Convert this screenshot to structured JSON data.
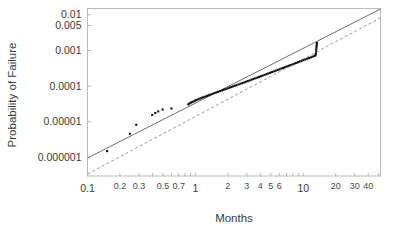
{
  "chart_data": {
    "type": "scatter",
    "title": "",
    "xlabel": "Months",
    "ylabel": "Probability of Failure",
    "xscale": "log",
    "yscale": "log",
    "xlim": [
      0.1,
      52
    ],
    "ylim": [
      3e-07,
      0.015
    ],
    "grid": false,
    "legend": "none",
    "xticks": [
      0.1,
      0.2,
      0.3,
      0.5,
      0.7,
      1,
      2,
      3,
      4,
      5,
      6,
      10,
      20,
      30,
      40
    ],
    "xtick_labels": [
      "0.1",
      "0.2",
      "0.3",
      "0.5",
      "0.7",
      "1",
      "2",
      "3",
      "4",
      "5",
      "6",
      "10",
      "20",
      "30",
      "40"
    ],
    "xtick_major": [
      "0.1",
      "1",
      "10"
    ],
    "yticks": [
      0.01,
      0.005,
      0.001,
      0.0001,
      1e-05,
      1e-06
    ],
    "ytick_labels": [
      "0.01",
      "0.005",
      "0.001",
      "0.0001",
      "0.00001",
      "0.000001"
    ],
    "series": [
      {
        "name": "Observed failures",
        "type": "scatter",
        "marker": "square",
        "color": "#101010",
        "points": [
          [
            0.152,
            1.5e-06
          ],
          [
            0.247,
            4.6e-06
          ],
          [
            0.283,
            8.2e-06
          ],
          [
            0.398,
            1.55e-05
          ],
          [
            0.425,
            1.75e-05
          ],
          [
            0.452,
            1.95e-05
          ],
          [
            0.497,
            2.2e-05
          ],
          [
            0.6,
            2.35e-05
          ],
          [
            0.86,
            3.05e-05
          ],
          [
            0.88,
            3.25e-05
          ],
          [
            0.905,
            3.4e-05
          ],
          [
            0.93,
            3.55e-05
          ],
          [
            0.96,
            3.7e-05
          ],
          [
            0.99,
            3.9e-05
          ],
          [
            1.02,
            4.05e-05
          ],
          [
            1.06,
            4.25e-05
          ],
          [
            1.1,
            4.45e-05
          ],
          [
            1.14,
            4.65e-05
          ],
          [
            1.18,
            4.85e-05
          ],
          [
            1.23,
            5.05e-05
          ],
          [
            1.28,
            5.3e-05
          ],
          [
            1.33,
            5.55e-05
          ],
          [
            1.38,
            5.8e-05
          ],
          [
            1.44,
            6.05e-05
          ],
          [
            1.5,
            6.35e-05
          ],
          [
            1.56,
            6.6e-05
          ],
          [
            1.62,
            6.9e-05
          ],
          [
            1.69,
            7.2e-05
          ],
          [
            1.76,
            7.55e-05
          ],
          [
            1.83,
            7.85e-05
          ],
          [
            1.9,
            8.2e-05
          ],
          [
            1.98,
            8.55e-05
          ],
          [
            2.06,
            8.95e-05
          ],
          [
            2.14,
            9.35e-05
          ],
          [
            2.23,
            9.75e-05
          ],
          [
            2.32,
            0.000102
          ],
          [
            2.41,
            0.000106
          ],
          [
            2.51,
            0.000111
          ],
          [
            2.61,
            0.000116
          ],
          [
            2.72,
            0.000121
          ],
          [
            2.83,
            0.000126
          ],
          [
            2.94,
            0.000132
          ],
          [
            3.06,
            0.000138
          ],
          [
            3.19,
            0.000144
          ],
          [
            3.32,
            0.000151
          ],
          [
            3.45,
            0.000158
          ],
          [
            3.59,
            0.000165
          ],
          [
            3.74,
            0.000172
          ],
          [
            3.89,
            0.00018
          ],
          [
            4.05,
            0.000189
          ],
          [
            4.21,
            0.000197
          ],
          [
            4.38,
            0.000206
          ],
          [
            4.56,
            0.000216
          ],
          [
            4.74,
            0.000226
          ],
          [
            4.93,
            0.000236
          ],
          [
            5.13,
            0.000247
          ],
          [
            5.34,
            0.000258
          ],
          [
            5.56,
            0.00027
          ],
          [
            5.78,
            0.000283
          ],
          [
            6.01,
            0.000296
          ],
          [
            6.26,
            0.00031
          ],
          [
            6.51,
            0.000324
          ],
          [
            6.77,
            0.000339
          ],
          [
            7.04,
            0.000355
          ],
          [
            7.33,
            0.000371
          ],
          [
            7.62,
            0.000388
          ],
          [
            7.93,
            0.000406
          ],
          [
            8.25,
            0.000425
          ],
          [
            8.58,
            0.000445
          ],
          [
            8.93,
            0.000466
          ],
          [
            9.29,
            0.000488
          ],
          [
            9.66,
            0.00051
          ],
          [
            10.05,
            0.000534
          ],
          [
            10.46,
            0.000559
          ],
          [
            10.88,
            0.000585
          ],
          [
            11.32,
            0.000612
          ],
          [
            11.77,
            0.000641
          ],
          [
            12.25,
            0.000671
          ],
          [
            12.74,
            0.000702
          ],
          [
            13.0,
            0.000735
          ],
          [
            13.1,
            0.00082
          ],
          [
            13.15,
            0.00094
          ],
          [
            13.2,
            0.00108
          ],
          [
            13.25,
            0.00122
          ],
          [
            13.3,
            0.00135
          ],
          [
            13.35,
            0.0015
          ],
          [
            13.4,
            0.00162
          ]
        ]
      },
      {
        "name": "Fit line (solid)",
        "type": "line",
        "style": "solid",
        "color": "#6e6e6e",
        "endpoints": [
          [
            0.1,
            9.6e-07
          ],
          [
            52,
            0.0145
          ]
        ]
      },
      {
        "name": "Fit line (dashed)",
        "type": "line",
        "style": "dashed",
        "color": "#9a9a9a",
        "endpoints": [
          [
            0.1,
            3.4e-07
          ],
          [
            52,
            0.0082
          ]
        ]
      }
    ]
  },
  "axes": {
    "x_title": "Months",
    "y_title": "Probability of Failure"
  }
}
